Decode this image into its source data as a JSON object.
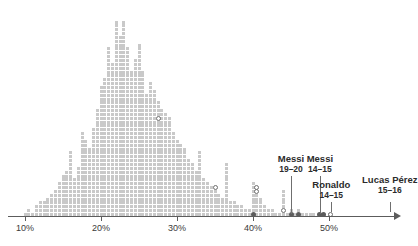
{
  "chart_data": {
    "type": "bar",
    "title": "",
    "subtitle": "",
    "xlabel": "",
    "ylabel": "",
    "grid": false,
    "legend": "none",
    "xlim": [
      8.5,
      59
    ],
    "ylim": [
      0,
      52
    ],
    "x_unit": "%",
    "tick_labels": [
      "10%",
      "20%",
      "30%",
      "40%",
      "50%"
    ],
    "tick_values": [
      10,
      20,
      30,
      40,
      50
    ],
    "bin_width": 0.5,
    "x": [
      10.0,
      10.5,
      11.0,
      11.5,
      12.0,
      12.5,
      13.0,
      13.5,
      14.0,
      14.5,
      15.0,
      15.5,
      16.0,
      16.5,
      17.0,
      17.5,
      18.0,
      18.5,
      19.0,
      19.5,
      20.0,
      20.5,
      21.0,
      21.5,
      22.0,
      22.5,
      23.0,
      23.5,
      24.0,
      24.5,
      25.0,
      25.5,
      26.0,
      26.5,
      27.0,
      27.5,
      28.0,
      28.5,
      29.0,
      29.5,
      30.0,
      30.5,
      31.0,
      31.5,
      32.0,
      32.5,
      33.0,
      33.5,
      34.0,
      34.5,
      35.0,
      35.5,
      36.0,
      36.5,
      37.0,
      37.5,
      38.0,
      38.5,
      39.0,
      39.5,
      40.0,
      40.5,
      41.0,
      41.5,
      42.0,
      42.5,
      43.0,
      43.5,
      44.0,
      44.5,
      45.0,
      45.5,
      46.0,
      46.5,
      47.0,
      47.5,
      48.0,
      48.5,
      49.0,
      49.5,
      50.0
    ],
    "values": [
      1,
      2,
      1,
      3,
      4,
      4,
      5,
      6,
      7,
      9,
      11,
      12,
      17,
      10,
      13,
      22,
      20,
      18,
      23,
      28,
      34,
      36,
      44,
      40,
      51,
      47,
      51,
      44,
      38,
      41,
      45,
      38,
      32,
      35,
      33,
      30,
      28,
      27,
      26,
      22,
      20,
      19,
      18,
      15,
      14,
      12,
      17,
      10,
      9,
      8,
      7,
      6,
      5,
      14,
      4,
      4,
      3,
      3,
      2,
      2,
      9,
      6,
      5,
      3,
      2,
      2,
      1,
      1,
      7,
      1,
      2,
      1,
      2,
      1,
      1,
      1,
      1,
      0,
      1,
      0,
      1
    ],
    "highlight_markers": [
      {
        "style": "hollow",
        "x": 27.5,
        "stack_index": 25
      },
      {
        "style": "hollow",
        "x": 35.0,
        "stack_index": 7
      },
      {
        "style": "hollow",
        "x": 40.5,
        "stack_index": 7
      },
      {
        "style": "hollow",
        "x": 40.5,
        "stack_index": 6
      },
      {
        "style": "hollow",
        "x": 44.0,
        "stack_index": 1
      },
      {
        "style": "solid",
        "x": 40.0,
        "stack_index": 0
      },
      {
        "style": "solid",
        "x": 45.0,
        "stack_index": 0
      },
      {
        "style": "solid",
        "x": 46.0,
        "stack_index": 0
      },
      {
        "style": "solid",
        "x": 48.8,
        "stack_index": 0
      },
      {
        "style": "solid",
        "x": 49.3,
        "stack_index": 0
      },
      {
        "style": "hollow",
        "x": 50.2,
        "stack_index": 0
      }
    ],
    "annotations": [
      {
        "name": "Messi",
        "season": "19–20",
        "x": 45.0,
        "label_y": 153,
        "leader_top": 176,
        "leader_bottom": 214,
        "has_leader": true
      },
      {
        "name": "Messi",
        "season": "14–15",
        "x": 48.8,
        "label_y": 153,
        "leader_top": 176,
        "leader_bottom": 214,
        "has_leader": true
      },
      {
        "name": "Ronaldo",
        "season": "14–15",
        "x": 50.3,
        "label_y": 179,
        "leader_top": 202,
        "leader_bottom": 212,
        "has_leader": true
      },
      {
        "name": "Lucas Pérez",
        "season": "15–16",
        "x": 58.0,
        "label_y": 174,
        "leader_top": 202,
        "leader_bottom": 212,
        "has_leader": true
      }
    ]
  },
  "colors": {
    "dot": "#c9c9c9",
    "axis": "#5c5c5c",
    "text": "#2b2b2b",
    "tick_text": "#3a3a3a",
    "marker_solid": "#5c5c5c",
    "marker_hollow_stroke": "#6f6f6f",
    "background": "#ffffff"
  }
}
